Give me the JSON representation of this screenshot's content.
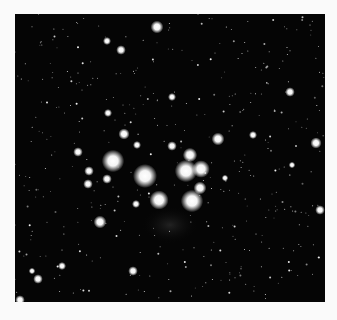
{
  "image": {
    "subject": "open star cluster photograph",
    "background_color": "#fafafa",
    "field_color": "#050505",
    "bright_stars": [
      {
        "x": 157,
        "y": 27,
        "r": 4
      },
      {
        "x": 107,
        "y": 41,
        "r": 2.5
      },
      {
        "x": 121,
        "y": 50,
        "r": 3
      },
      {
        "x": 290,
        "y": 92,
        "r": 3
      },
      {
        "x": 172,
        "y": 97,
        "r": 2.5
      },
      {
        "x": 108,
        "y": 113,
        "r": 2.5
      },
      {
        "x": 124,
        "y": 134,
        "r": 3.5
      },
      {
        "x": 218,
        "y": 139,
        "r": 4
      },
      {
        "x": 316,
        "y": 143,
        "r": 3.5
      },
      {
        "x": 137,
        "y": 145,
        "r": 2.5
      },
      {
        "x": 172,
        "y": 146,
        "r": 3
      },
      {
        "x": 113,
        "y": 161,
        "r": 7
      },
      {
        "x": 78,
        "y": 152,
        "r": 3
      },
      {
        "x": 190,
        "y": 155,
        "r": 4.5
      },
      {
        "x": 145,
        "y": 176,
        "r": 7.5
      },
      {
        "x": 186,
        "y": 171,
        "r": 7
      },
      {
        "x": 201,
        "y": 169,
        "r": 5.5
      },
      {
        "x": 89,
        "y": 171,
        "r": 3
      },
      {
        "x": 107,
        "y": 179,
        "r": 3
      },
      {
        "x": 88,
        "y": 184,
        "r": 3
      },
      {
        "x": 200,
        "y": 188,
        "r": 4
      },
      {
        "x": 159,
        "y": 200,
        "r": 6
      },
      {
        "x": 192,
        "y": 201,
        "r": 7
      },
      {
        "x": 136,
        "y": 204,
        "r": 2.5
      },
      {
        "x": 320,
        "y": 210,
        "r": 3
      },
      {
        "x": 100,
        "y": 222,
        "r": 4
      },
      {
        "x": 133,
        "y": 271,
        "r": 3
      },
      {
        "x": 38,
        "y": 279,
        "r": 3
      },
      {
        "x": 62,
        "y": 266,
        "r": 2.5
      },
      {
        "x": 32,
        "y": 271,
        "r": 2
      },
      {
        "x": 292,
        "y": 165,
        "r": 2
      },
      {
        "x": 253,
        "y": 135,
        "r": 2.5
      },
      {
        "x": 225,
        "y": 178,
        "r": 2
      },
      {
        "x": 20,
        "y": 300,
        "r": 3
      }
    ]
  }
}
